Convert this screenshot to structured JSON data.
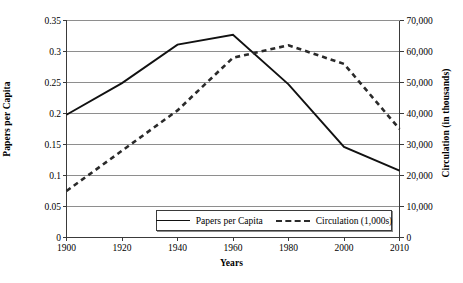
{
  "chart_data": {
    "type": "line",
    "title": "",
    "xlabel": "Years",
    "ylabel": "Papers per Capita",
    "y2label": "Circulation (in thousands)",
    "grid": true,
    "grid_axis": "y",
    "legend_position": "inside-bottom-center",
    "categories": [
      1900,
      1920,
      1940,
      1960,
      1980,
      2000,
      2010
    ],
    "x_tick_labels": [
      "1900",
      "1920",
      "1940",
      "1960",
      "1980",
      "2000",
      "2010"
    ],
    "ylim": [
      0,
      0.35
    ],
    "y_ticks": [
      0,
      0.05,
      0.1,
      0.15,
      0.2,
      0.25,
      0.3,
      0.35
    ],
    "y_tick_labels": [
      "0",
      "0.05",
      "0.1",
      "0.15",
      "0.2",
      "0.25",
      "0.3",
      "0.35"
    ],
    "y2lim": [
      0,
      70000
    ],
    "y2_ticks": [
      0,
      10000,
      20000,
      30000,
      40000,
      50000,
      60000,
      70000
    ],
    "y2_tick_labels": [
      "0",
      "10,000",
      "20,000",
      "30,000",
      "40,000",
      "50,000",
      "60,000",
      "70,000"
    ],
    "series": [
      {
        "name": "Papers per Capita",
        "legend_label": "Papers per Capita",
        "axis": "left",
        "style": "solid",
        "color": "#111111",
        "x": [
          1900,
          1920,
          1940,
          1960,
          1980,
          2000,
          2010
        ],
        "values": [
          0.198,
          0.249,
          0.311,
          0.327,
          0.247,
          0.146,
          0.108
        ]
      },
      {
        "name": "Circulation (1,000s)",
        "legend_label": "Circulation (1,000s)",
        "axis": "right",
        "style": "dashed",
        "color": "#2a2a2a",
        "x": [
          1900,
          1920,
          1940,
          1960,
          1980,
          2000,
          2010
        ],
        "values": [
          15000,
          28000,
          41000,
          58000,
          62000,
          56000,
          35000
        ]
      }
    ]
  },
  "axes": {
    "left_title": "Papers per Capita",
    "right_title": "Circulation (in thousands)",
    "bottom_title": "Years"
  },
  "legend": {
    "items": [
      {
        "label": "Papers per Capita",
        "style": "solid"
      },
      {
        "label": "Circulation (1,000s)",
        "style": "dashed"
      }
    ]
  }
}
